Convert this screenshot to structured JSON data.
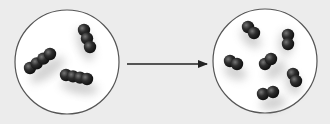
{
  "diagram": {
    "background": "#ececec",
    "left_panel": {
      "label": "",
      "circle": {
        "cx": 67,
        "cy": 62,
        "r": 52,
        "fill": "#ffffff",
        "stroke": "#555555"
      },
      "molecules": [
        {
          "type": "chain-4",
          "x1": 30,
          "y1": 68,
          "x2": 50,
          "y2": 54
        },
        {
          "type": "chain-3",
          "x1": 84,
          "y1": 30,
          "x2": 90,
          "y2": 47
        },
        {
          "type": "chain-4",
          "x1": 66,
          "y1": 75,
          "x2": 87,
          "y2": 79
        }
      ]
    },
    "arrow": {
      "x1": 127,
      "y1": 64,
      "x2": 207,
      "y2": 64,
      "color": "#222222"
    },
    "right_panel": {
      "label": "",
      "circle": {
        "cx": 265,
        "cy": 61,
        "r": 52,
        "fill": "#ffffff",
        "stroke": "#555555"
      },
      "molecules": [
        {
          "type": "diatomic",
          "x1": 248,
          "y1": 27,
          "x2": 254,
          "y2": 33
        },
        {
          "type": "diatomic",
          "x1": 288,
          "y1": 35,
          "x2": 288,
          "y2": 44
        },
        {
          "type": "diatomic",
          "x1": 230,
          "y1": 61,
          "x2": 237,
          "y2": 64
        },
        {
          "type": "diatomic",
          "x1": 265,
          "y1": 64,
          "x2": 271,
          "y2": 59
        },
        {
          "type": "diatomic",
          "x1": 293,
          "y1": 74,
          "x2": 296,
          "y2": 81
        },
        {
          "type": "diatomic",
          "x1": 263,
          "y1": 94,
          "x2": 273,
          "y2": 92
        }
      ]
    }
  }
}
